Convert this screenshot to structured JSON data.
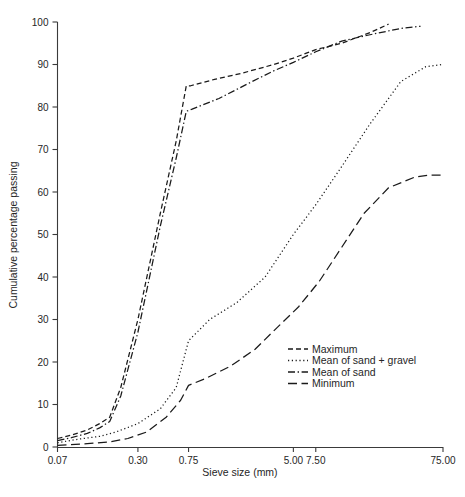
{
  "chart_data": {
    "type": "line",
    "title": "",
    "xlabel": "Sieve size (mm)",
    "ylabel": "Cumulative percentage passing",
    "grid": false,
    "legend_position": "inside-lower-right",
    "x_scale": "log",
    "xlim": [
      0.07,
      75.0
    ],
    "ylim": [
      0,
      100
    ],
    "x_ticks": [
      0.07,
      0.3,
      0.75,
      5.0,
      7.5,
      75.0
    ],
    "x_tick_labels": [
      "0.07",
      "0.30",
      "0.75",
      "5.00",
      "7.50",
      "75.00"
    ],
    "y_ticks": [
      0,
      10,
      20,
      30,
      40,
      50,
      60,
      70,
      80,
      90,
      100
    ],
    "y_tick_labels": [
      "0",
      "10",
      "20",
      "30",
      "40",
      "50",
      "60",
      "70",
      "80",
      "90",
      "100"
    ],
    "series": [
      {
        "name": "Maximum",
        "style": "dashed",
        "x": [
          0.07,
          0.09,
          0.12,
          0.15,
          0.18,
          0.22,
          0.3,
          0.45,
          0.6,
          0.72,
          0.78,
          1.2,
          2.0,
          3.5,
          5.0,
          7.5,
          12.0,
          20.0,
          28.0
        ],
        "y": [
          2.0,
          2.8,
          4.0,
          5.5,
          7.0,
          14.0,
          30.0,
          55.0,
          72.0,
          85.0,
          85.0,
          86.5,
          88.0,
          90.0,
          91.5,
          93.5,
          95.0,
          97.5,
          99.5
        ]
      },
      {
        "name": "Mean of sand + gravel",
        "style": "dotted",
        "x": [
          0.07,
          0.1,
          0.15,
          0.2,
          0.3,
          0.45,
          0.6,
          0.75,
          1.1,
          1.8,
          3.0,
          5.0,
          7.5,
          12.0,
          20.0,
          35.0,
          55.0,
          75.0
        ],
        "y": [
          1.0,
          1.8,
          2.5,
          3.5,
          5.5,
          9.0,
          14.0,
          25.0,
          30.0,
          34.0,
          40.0,
          50.0,
          57.0,
          66.0,
          76.0,
          86.0,
          89.5,
          90.0
        ]
      },
      {
        "name": "Mean of sand",
        "style": "dashdot",
        "x": [
          0.07,
          0.09,
          0.12,
          0.15,
          0.18,
          0.22,
          0.3,
          0.45,
          0.6,
          0.72,
          0.8,
          1.3,
          2.2,
          3.5,
          5.0,
          7.5,
          12.0,
          20.0,
          35.0,
          50.0
        ],
        "y": [
          1.5,
          2.2,
          3.2,
          4.5,
          6.0,
          12.0,
          27.0,
          52.0,
          68.0,
          79.0,
          79.5,
          82.0,
          85.5,
          88.5,
          90.5,
          93.0,
          95.5,
          97.0,
          98.5,
          99.0
        ]
      },
      {
        "name": "Minimum",
        "style": "longdash",
        "x": [
          0.07,
          0.12,
          0.18,
          0.25,
          0.35,
          0.5,
          0.65,
          0.75,
          1.0,
          1.6,
          2.5,
          4.0,
          5.5,
          8.0,
          12.0,
          18.0,
          28.0,
          45.0,
          60.0,
          75.0
        ],
        "y": [
          0.4,
          0.8,
          1.2,
          2.0,
          3.5,
          7.0,
          11.0,
          14.5,
          16.0,
          19.0,
          23.0,
          29.0,
          33.0,
          39.0,
          47.0,
          55.0,
          61.0,
          63.5,
          64.0,
          64.0
        ]
      }
    ],
    "legend": [
      {
        "label": "Maximum",
        "style": "dashed"
      },
      {
        "label": "Mean of sand + gravel",
        "style": "dotted"
      },
      {
        "label": "Mean of sand",
        "style": "dashdot"
      },
      {
        "label": "Minimum",
        "style": "longdash"
      }
    ]
  }
}
